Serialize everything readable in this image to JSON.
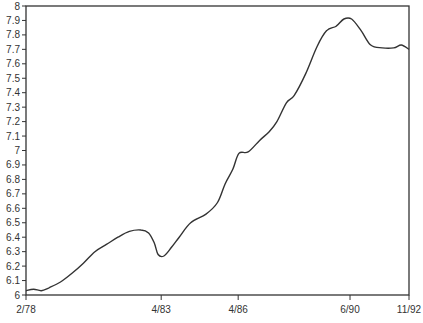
{
  "chart_data": {
    "type": "line",
    "title": "",
    "xlabel": "",
    "ylabel": "",
    "ylim": [
      6,
      8
    ],
    "grid": false,
    "legend": null,
    "y_ticks": [
      "6",
      "6.1",
      "6.2",
      "6.3",
      "6.4",
      "6.5",
      "6.6",
      "6.7",
      "6.8",
      "6.9",
      "7",
      "7.1",
      "7.2",
      "7.3",
      "7.4",
      "7.5",
      "7.6",
      "7.7",
      "7.8",
      "7.9",
      "8"
    ],
    "x_ticks": [
      {
        "label": "2/78",
        "pos": 0.0
      },
      {
        "label": "4/83",
        "pos": 0.353
      },
      {
        "label": "4/86",
        "pos": 0.554
      },
      {
        "label": "6/90",
        "pos": 0.846
      },
      {
        "label": "11/92",
        "pos": 1.0
      }
    ],
    "series": [
      {
        "name": "series-1",
        "color": "#333333",
        "points": [
          [
            0.0,
            6.03
          ],
          [
            0.02,
            6.04
          ],
          [
            0.04,
            6.03
          ],
          [
            0.06,
            6.05
          ],
          [
            0.09,
            6.09
          ],
          [
            0.12,
            6.15
          ],
          [
            0.15,
            6.22
          ],
          [
            0.18,
            6.3
          ],
          [
            0.21,
            6.35
          ],
          [
            0.24,
            6.4
          ],
          [
            0.27,
            6.44
          ],
          [
            0.3,
            6.45
          ],
          [
            0.32,
            6.43
          ],
          [
            0.335,
            6.36
          ],
          [
            0.345,
            6.28
          ],
          [
            0.36,
            6.27
          ],
          [
            0.38,
            6.33
          ],
          [
            0.4,
            6.4
          ],
          [
            0.43,
            6.5
          ],
          [
            0.47,
            6.56
          ],
          [
            0.5,
            6.64
          ],
          [
            0.52,
            6.77
          ],
          [
            0.54,
            6.87
          ],
          [
            0.556,
            6.98
          ],
          [
            0.58,
            6.99
          ],
          [
            0.61,
            7.07
          ],
          [
            0.635,
            7.13
          ],
          [
            0.655,
            7.2
          ],
          [
            0.68,
            7.33
          ],
          [
            0.7,
            7.38
          ],
          [
            0.73,
            7.53
          ],
          [
            0.76,
            7.72
          ],
          [
            0.785,
            7.83
          ],
          [
            0.81,
            7.86
          ],
          [
            0.83,
            7.91
          ],
          [
            0.85,
            7.91
          ],
          [
            0.875,
            7.83
          ],
          [
            0.9,
            7.73
          ],
          [
            0.93,
            7.71
          ],
          [
            0.96,
            7.71
          ],
          [
            0.98,
            7.73
          ],
          [
            1.0,
            7.7
          ]
        ]
      }
    ]
  }
}
